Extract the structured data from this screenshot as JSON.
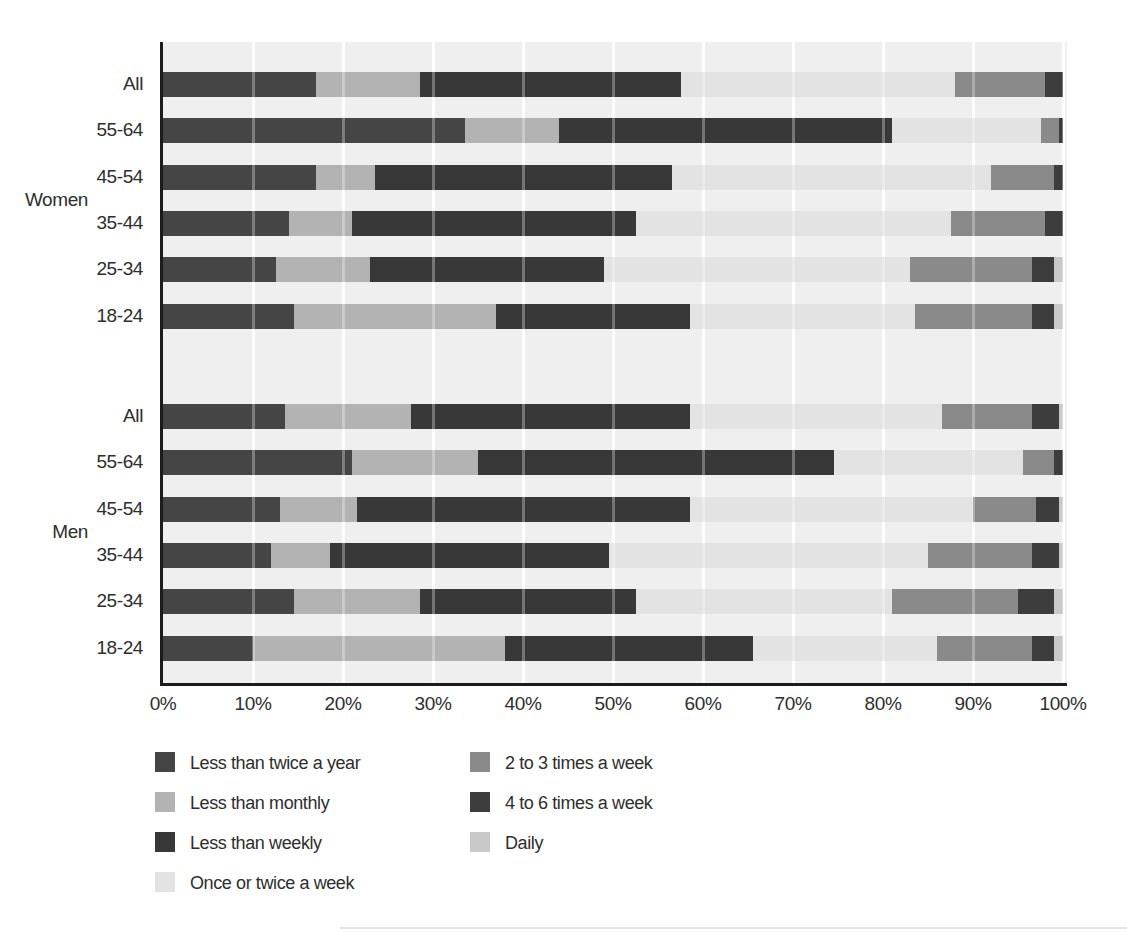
{
  "chart_data": {
    "type": "bar",
    "subtype": "horizontal-stacked-100-percent",
    "title": "",
    "xlabel": "",
    "ylabel": "",
    "xlim": [
      0,
      100
    ],
    "grid": true,
    "x_axis": {
      "tick_labels": [
        "0%",
        "10%",
        "20%",
        "30%",
        "40%",
        "50%",
        "60%",
        "70%",
        "80%",
        "90%",
        "100%"
      ],
      "tick_values": [
        0,
        10,
        20,
        30,
        40,
        50,
        60,
        70,
        80,
        90,
        100
      ]
    },
    "categories": [
      {
        "label": "Less than twice a year",
        "color": "#454545"
      },
      {
        "label": "Less than monthly",
        "color": "#b3b3b3"
      },
      {
        "label": "Less than weekly",
        "color": "#383838"
      },
      {
        "label": "Once or twice a week",
        "color": "#e3e3e3"
      },
      {
        "label": "2 to 3 times a week",
        "color": "#8a8a8a"
      },
      {
        "label": "4 to 6 times a week",
        "color": "#3d3d3d"
      },
      {
        "label": "Daily",
        "color": "#c9c9c9"
      }
    ],
    "groups": [
      {
        "label": "Women",
        "rows": [
          {
            "label": "All",
            "values": [
              17,
              11.5,
              29,
              30.5,
              10,
              2,
              0
            ]
          },
          {
            "label": "55-64",
            "values": [
              33.5,
              10.5,
              37,
              16.5,
              2,
              0.5,
              0
            ]
          },
          {
            "label": "45-54",
            "values": [
              17,
              6.5,
              33,
              35.5,
              7,
              1,
              0
            ]
          },
          {
            "label": "35-44",
            "values": [
              14,
              7,
              31.5,
              35,
              10.5,
              2,
              0
            ]
          },
          {
            "label": "25-34",
            "values": [
              12.5,
              10.5,
              26,
              34,
              13.5,
              2.5,
              1
            ]
          },
          {
            "label": "18-24",
            "values": [
              14.5,
              22.5,
              21.5,
              25,
              13,
              2.5,
              1
            ]
          }
        ]
      },
      {
        "label": "Men",
        "rows": [
          {
            "label": "All",
            "values": [
              13.5,
              14,
              31,
              28,
              10,
              3,
              0.5
            ]
          },
          {
            "label": "55-64",
            "values": [
              21,
              14,
              39.5,
              21,
              3.5,
              1,
              0
            ]
          },
          {
            "label": "45-54",
            "values": [
              13,
              8.5,
              37,
              31.5,
              7,
              2.5,
              0.5
            ]
          },
          {
            "label": "35-44",
            "values": [
              12,
              6.5,
              31,
              35.5,
              11.5,
              3,
              0.5
            ]
          },
          {
            "label": "25-34",
            "values": [
              14.5,
              14,
              24,
              28.5,
              14,
              4,
              1
            ]
          },
          {
            "label": "18-24",
            "values": [
              10,
              28,
              27.5,
              20.5,
              10.5,
              2.5,
              1
            ]
          }
        ]
      }
    ],
    "legend": {
      "position": "bottom-left",
      "columns": 2,
      "column1_items": [
        "Less than twice a year",
        "Less than monthly",
        "Less than weekly",
        "Once or twice a week"
      ],
      "column2_items": [
        "2 to 3 times a week",
        "4 to 6 times a week",
        "Daily"
      ]
    }
  },
  "styles": {
    "plot_background": "#efefef",
    "gridline_color": "#ffffff",
    "axis_color": "#1c1c1c",
    "text_color": "#2e2e2e"
  }
}
